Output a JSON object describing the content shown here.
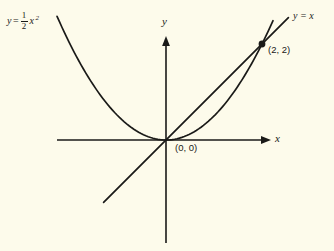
{
  "figure": {
    "background_color": "#fdfbeb",
    "ink_color": "#1a1a18",
    "axis_labels": {
      "x": "x",
      "y": "y"
    },
    "point_labels": {
      "origin": "(0, 0)",
      "intersection": "(2, 2)"
    },
    "curve_labels": {
      "parabola_prefix": "y",
      "parabola_equals": "=",
      "parabola_numerator": "1",
      "parabola_denominator": "2",
      "parabola_variable": "x",
      "parabola_exponent": "2",
      "line": "y = x"
    }
  },
  "chart_data": {
    "type": "line",
    "title": "",
    "xlabel": "x",
    "ylabel": "y",
    "grid": false,
    "legend": "inline-curve-labels",
    "xlim": [
      -2.2,
      2.8
    ],
    "ylim": [
      -2.3,
      4.6
    ],
    "origin_px": [
      166,
      140
    ],
    "px_per_unit": [
      48,
      48
    ],
    "series": [
      {
        "name": "y = 1/2 x^2",
        "equation": "y = (1/2)x^2",
        "label": "y = ½x²",
        "label_pos_px": [
          8,
          12
        ],
        "x": [
          -2.25,
          -2.0,
          -1.75,
          -1.5,
          -1.25,
          -1.0,
          -0.75,
          -0.5,
          -0.25,
          0.0,
          0.25,
          0.5,
          0.75,
          1.0,
          1.25,
          1.5,
          1.75,
          2.0,
          2.25,
          2.5
        ],
        "y": [
          2.531,
          2.0,
          1.531,
          1.125,
          0.781,
          0.5,
          0.281,
          0.125,
          0.031,
          0.0,
          0.031,
          0.125,
          0.281,
          0.5,
          0.781,
          1.125,
          1.531,
          2.0,
          2.531,
          3.125
        ]
      },
      {
        "name": "y = x",
        "equation": "y = x",
        "label": "y = x",
        "label_pos_px": [
          295,
          12
        ],
        "x": [
          -1.3,
          2.55
        ],
        "y": [
          -1.3,
          2.55
        ]
      }
    ],
    "points": [
      {
        "label": "(0, 0)",
        "x": 0,
        "y": 0,
        "marker": "none"
      },
      {
        "label": "(2, 2)",
        "x": 2,
        "y": 2,
        "marker": "filled-dot"
      }
    ],
    "annotations": [
      {
        "text": "(0, 0)",
        "x_px": 176,
        "y_px": 144
      },
      {
        "text": "(2, 2)",
        "x_px": 268,
        "y_px": 47
      }
    ]
  }
}
